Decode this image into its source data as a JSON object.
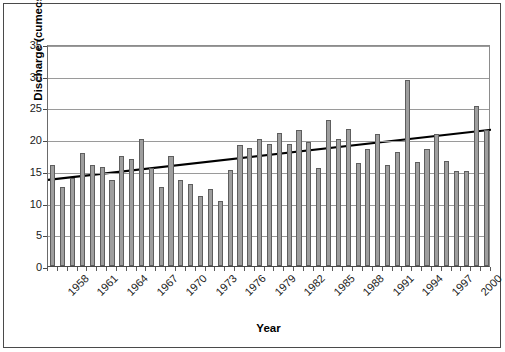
{
  "chart_data": {
    "type": "bar",
    "title": "",
    "xlabel": "Year",
    "ylabel": "Discharge (cumecs)",
    "ylim": [
      0,
      35
    ],
    "ytick_values": [
      0,
      5,
      10,
      15,
      20,
      25,
      30,
      35
    ],
    "ytick_labels": [
      "0",
      "5",
      "10",
      "15",
      "20",
      "25",
      "30",
      "35"
    ],
    "grid": true,
    "legend": "none",
    "categories": [
      "1958",
      "1959",
      "1960",
      "1961",
      "1962",
      "1963",
      "1964",
      "1965",
      "1966",
      "1967",
      "1968",
      "1969",
      "1970",
      "1971",
      "1972",
      "1973",
      "1974",
      "1975",
      "1976",
      "1977",
      "1978",
      "1979",
      "1980",
      "1981",
      "1982",
      "1983",
      "1984",
      "1985",
      "1986",
      "1987",
      "1988",
      "1989",
      "1990",
      "1991",
      "1992",
      "1993",
      "1994",
      "1995",
      "1996",
      "1997",
      "1998",
      "1999",
      "2000",
      "2001",
      "2002"
    ],
    "xtick_labels": [
      "1958",
      "1961",
      "1964",
      "1967",
      "1970",
      "1973",
      "1976",
      "1979",
      "1982",
      "1985",
      "1988",
      "1991",
      "1994",
      "1997",
      "2000"
    ],
    "xtick_label_every": 3,
    "values": [
      16.0,
      12.4,
      13.8,
      17.8,
      16.0,
      15.6,
      13.5,
      17.3,
      16.8,
      20.1,
      15.4,
      12.4,
      17.4,
      13.6,
      12.9,
      11.1,
      12.2,
      10.3,
      15.2,
      19.1,
      18.6,
      20.0,
      19.3,
      21.0,
      19.3,
      21.5,
      19.5,
      15.4,
      23.0,
      20.0,
      21.6,
      16.3,
      18.5,
      20.8,
      15.9,
      18.0,
      29.3,
      16.4,
      18.5,
      20.8,
      16.5,
      15.0,
      15.0,
      25.2,
      21.5
    ],
    "series": [
      {
        "name": "Discharge",
        "type": "bar",
        "color": "#9e9e9e",
        "edge_color": "#5e5e5e",
        "values": [
          16.0,
          12.4,
          13.8,
          17.8,
          16.0,
          15.6,
          13.5,
          17.3,
          16.8,
          20.1,
          15.4,
          12.4,
          17.4,
          13.6,
          12.9,
          11.1,
          12.2,
          10.3,
          15.2,
          19.1,
          18.6,
          20.0,
          19.3,
          21.0,
          19.3,
          21.5,
          19.5,
          15.4,
          23.0,
          20.0,
          21.6,
          16.3,
          18.5,
          20.8,
          15.9,
          18.0,
          29.3,
          16.4,
          18.5,
          20.8,
          16.5,
          15.0,
          15.0,
          25.2,
          21.5
        ]
      },
      {
        "name": "Linear trend",
        "type": "line",
        "color": "#000000",
        "start_value": 13.9,
        "end_value": 21.8
      }
    ]
  },
  "axes": {
    "y_title": "Discharge (cumecs)",
    "x_title": "Year"
  }
}
